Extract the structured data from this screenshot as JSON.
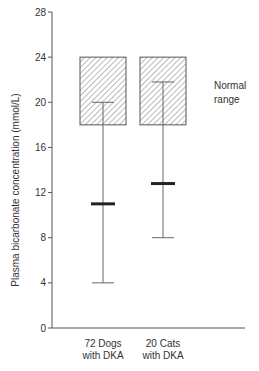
{
  "chart_data": {
    "type": "range",
    "title": "",
    "xlabel": "",
    "ylabel": "Plasma bicarbonate concentration (mmol/L)",
    "ylim": [
      0,
      28
    ],
    "yticks": [
      0,
      4,
      8,
      12,
      16,
      20,
      24,
      28
    ],
    "grid": false,
    "categories": [
      [
        "72 Dogs",
        "with DKA"
      ],
      [
        "20 Cats",
        "with DKA"
      ]
    ],
    "series": [
      {
        "name": "72 Dogs with DKA",
        "min": 4,
        "mean": 11,
        "max": 20
      },
      {
        "name": "20 Cats with DKA",
        "min": 8,
        "mean": 12.8,
        "max": 21.8
      }
    ],
    "normal_range": {
      "low": 18,
      "high": 24,
      "label": [
        "Normal",
        "range"
      ]
    },
    "annotations": [
      "Normal range"
    ]
  },
  "colors": {
    "axis": "#555555",
    "whisker": "#666666",
    "mean_bar": "#222222",
    "hatch": "#777777",
    "text": "#333333"
  }
}
